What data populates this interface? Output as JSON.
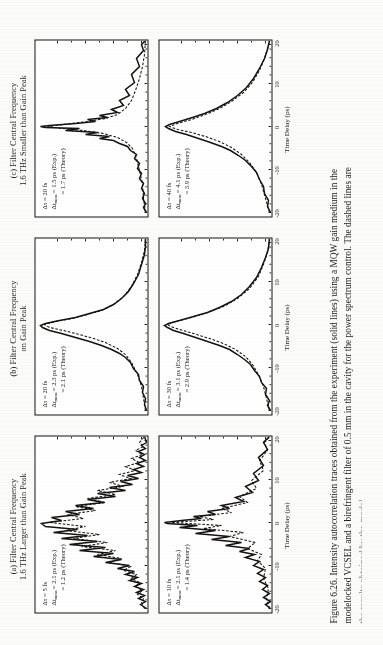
{
  "figure": {
    "number": "Figure 6.26.",
    "column_headers": [
      "(a) Filter Central Frequency\n1.6 THz Larger than Gain Peak",
      "(b) Filter Central Frequency\non Gain Peak",
      "(c) Filter Central Frequency\n1.6 THz Smaller than Gain Peak"
    ],
    "axis": {
      "xlabel": "Time Delay (ps)",
      "xticks": [
        "-20",
        "-10",
        "0",
        "10",
        "20"
      ],
      "xlim": [
        -20,
        20
      ],
      "ylim": [
        0,
        1
      ]
    },
    "caption_lines": [
      "Figure 6.26.   Intensity autocorrelation traces obtained from the experiment (solid lines) using a MQW  gain medium in the",
      "modelocked VCSEL and a birefringent filter of 0.5 mm in the cavity for the power spectrum control. The dashed lines are",
      "the results obtained by the model."
    ],
    "legend": {
      "solid": "Experiment (solid lines)",
      "dashed": "Theory (dashed lines)"
    }
  },
  "chart_data": {
    "type": "line",
    "title": "Intensity autocorrelation traces",
    "xlabel": "Time Delay (ps)",
    "ylabel": "",
    "xlim": [
      -20,
      20
    ],
    "ylim": [
      0,
      1
    ],
    "grid": false,
    "legend_position": "none",
    "panels": [
      {
        "id": "a-top",
        "row": 0,
        "col": 0,
        "header": "(a) Filter Central Frequency 1.6 THz Larger than Gain Peak",
        "annotations": {
          "delta_tau": "Δτ = 5 fs",
          "dt_exp": "Δt_meas = 2.1 ps (Exp.)",
          "dt_theory": "= 1.2 ps (Theory)"
        },
        "series": [
          {
            "name": "Experiment",
            "style": "solid"
          },
          {
            "name": "Theory",
            "style": "dashed"
          }
        ],
        "shape": "multi-peak with strong side lobes at ±4 ps and ±8 ps, noisy baseline"
      },
      {
        "id": "a-bottom",
        "row": 1,
        "col": 0,
        "header": "(a) Filter Central Frequency 1.6 THz Larger than Gain Peak",
        "annotations": {
          "delta_tau": "Δτ = 10 fs",
          "dt_exp": "Δt_meas = 2.1 ps (Exp.)",
          "dt_theory": "= 1.4 ps (Theory)"
        },
        "series": [
          {
            "name": "Experiment",
            "style": "solid"
          },
          {
            "name": "Theory",
            "style": "dashed"
          }
        ],
        "shape": "central peak with modest side lobes, noisy wings"
      },
      {
        "id": "b-top",
        "row": 0,
        "col": 1,
        "header": "(b) Filter Central Frequency on Gain Peak",
        "annotations": {
          "delta_tau": "Δτ = 20 fs",
          "dt_exp": "Δt_meas = 2.3 ps (Exp.)",
          "dt_theory": "= 2.1 ps (Theory)"
        },
        "series": [
          {
            "name": "Experiment",
            "style": "solid"
          },
          {
            "name": "Theory",
            "style": "dashed"
          }
        ],
        "shape": "single clean sharp peak on broad pedestal"
      },
      {
        "id": "b-bottom",
        "row": 1,
        "col": 1,
        "header": "(b) Filter Central Frequency on Gain Peak",
        "annotations": {
          "delta_tau": "Δτ = 30 fs",
          "dt_exp": "Δt_meas = 3.1 ps (Exp.)",
          "dt_theory": "= 2.9 ps (Theory)"
        },
        "series": [
          {
            "name": "Experiment",
            "style": "solid"
          },
          {
            "name": "Theory",
            "style": "dashed"
          }
        ],
        "shape": "single broad smooth peak, wider pedestal"
      },
      {
        "id": "c-top",
        "row": 0,
        "col": 2,
        "header": "(c) Filter Central Frequency 1.6 THz Smaller than Gain Peak",
        "annotations": {
          "delta_tau": "Δτ = 20 fs",
          "dt_exp": "Δt_meas = 1.5 ps (Exp.)",
          "dt_theory": "= 1.7 ps (Theory)"
        },
        "series": [
          {
            "name": "Experiment",
            "style": "solid"
          },
          {
            "name": "Theory",
            "style": "dashed"
          }
        ],
        "shape": "narrow spike with small structured shoulders"
      },
      {
        "id": "c-bottom",
        "row": 1,
        "col": 2,
        "header": "(c) Filter Central Frequency 1.6 THz Smaller than Gain Peak",
        "annotations": {
          "delta_tau": "Δτ = 40 fs",
          "dt_exp": "Δt_meas = 4.1 ps (Exp.)",
          "dt_theory": "= 3.9 ps (Theory)"
        },
        "series": [
          {
            "name": "Experiment",
            "style": "solid"
          },
          {
            "name": "Theory",
            "style": "dashed"
          }
        ],
        "shape": "broad single peak, smooth flanks"
      }
    ]
  }
}
